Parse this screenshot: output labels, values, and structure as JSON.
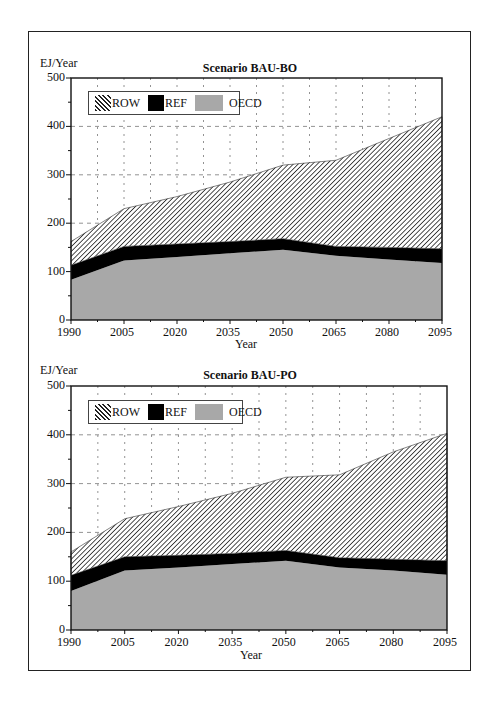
{
  "chart_data": [
    {
      "type": "area",
      "stacked": true,
      "title": "Scenario BAU-BO",
      "xlabel": "Year",
      "ylabel": "EJ/Year",
      "ylim": [
        0,
        500
      ],
      "yticks": [
        0,
        100,
        200,
        300,
        400,
        500
      ],
      "categories": [
        "1990",
        "2005",
        "2020",
        "2035",
        "2050",
        "2065",
        "2080",
        "2095"
      ],
      "grid": true,
      "legend_position": "top-left inside",
      "series": [
        {
          "name": "OECD",
          "fill": "gray",
          "values": [
            83,
            123,
            130,
            138,
            145,
            133,
            125,
            118
          ]
        },
        {
          "name": "REF",
          "fill": "black",
          "values": [
            30,
            29,
            27,
            24,
            23,
            19,
            25,
            29
          ]
        },
        {
          "name": "ROW",
          "fill": "hatched",
          "values": [
            49,
            78,
            98,
            123,
            152,
            178,
            225,
            273
          ]
        }
      ],
      "totals": [
        162,
        230,
        255,
        285,
        320,
        330,
        375,
        420
      ]
    },
    {
      "type": "area",
      "stacked": true,
      "title": "Scenario BAU-PO",
      "xlabel": "Year",
      "ylabel": "EJ/Year",
      "ylim": [
        0,
        500
      ],
      "yticks": [
        0,
        100,
        200,
        300,
        400,
        500
      ],
      "categories": [
        "1990",
        "2005",
        "2020",
        "2035",
        "2050",
        "2065",
        "2080",
        "2095"
      ],
      "grid": true,
      "legend_position": "top-left inside",
      "series": [
        {
          "name": "OECD",
          "fill": "gray",
          "values": [
            80,
            122,
            128,
            135,
            142,
            128,
            122,
            113
          ]
        },
        {
          "name": "REF",
          "fill": "black",
          "values": [
            32,
            28,
            25,
            22,
            21,
            20,
            23,
            29
          ]
        },
        {
          "name": "ROW",
          "fill": "hatched",
          "values": [
            48,
            78,
            100,
            123,
            150,
            170,
            220,
            261
          ]
        }
      ],
      "totals": [
        160,
        228,
        253,
        280,
        313,
        318,
        365,
        403
      ]
    }
  ],
  "charts": [
    {
      "title": "Scenario BAU-BO",
      "ylabel": "EJ/Year",
      "xlabel": "Year",
      "legend": [
        "ROW",
        "REF",
        "OECD"
      ],
      "yticks": [
        "500",
        "400",
        "300",
        "200",
        "100",
        "0"
      ],
      "xticks": [
        "1990",
        "2005",
        "2020",
        "2035",
        "2050",
        "2065",
        "2080",
        "2095"
      ]
    },
    {
      "title": "Scenario BAU-PO",
      "ylabel": "EJ/Year",
      "xlabel": "Year",
      "legend": [
        "ROW",
        "REF",
        "OECD"
      ],
      "yticks": [
        "500",
        "400",
        "300",
        "200",
        "100",
        "0"
      ],
      "xticks": [
        "1990",
        "2005",
        "2020",
        "2035",
        "2050",
        "2065",
        "2080",
        "2095"
      ]
    }
  ],
  "colors": {
    "oecd": "#a8a8a8",
    "ref": "#000000",
    "row_hatch": "#222222"
  }
}
